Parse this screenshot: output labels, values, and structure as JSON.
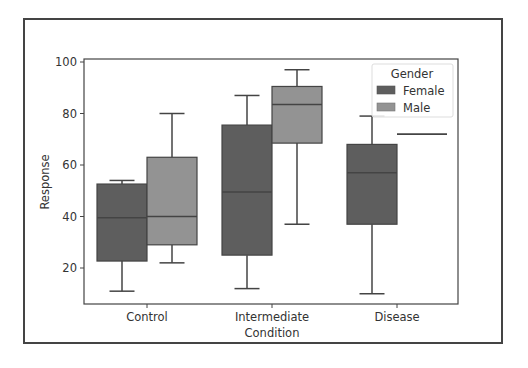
{
  "chart_data": {
    "type": "box",
    "title": "",
    "xlabel": "Condition",
    "ylabel": "Response",
    "categories": [
      "Control",
      "Intermediate",
      "Disease"
    ],
    "yticks": [
      20,
      40,
      60,
      80,
      100
    ],
    "ylim": [
      5.6,
      101
    ],
    "grid": false,
    "legend": {
      "title": "Gender",
      "position": "upper right",
      "entries": [
        "Female",
        "Male"
      ]
    },
    "series": [
      {
        "name": "Female",
        "color": "#5e5e5e",
        "boxes": [
          {
            "category": "Control",
            "whisker_low": 11,
            "q1": 22.7,
            "median": 39.5,
            "q3": 52.6,
            "whisker_high": 54
          },
          {
            "category": "Intermediate",
            "whisker_low": 12,
            "q1": 25,
            "median": 49.5,
            "q3": 75.5,
            "whisker_high": 87
          },
          {
            "category": "Disease",
            "whisker_low": 10,
            "q1": 37,
            "median": 57,
            "q3": 68,
            "whisker_high": 79
          }
        ]
      },
      {
        "name": "Male",
        "color": "#939393",
        "boxes": [
          {
            "category": "Control",
            "whisker_low": 22,
            "q1": 29,
            "median": 40,
            "q3": 63,
            "whisker_high": 80
          },
          {
            "category": "Intermediate",
            "whisker_low": 37,
            "q1": 68.5,
            "median": 83.5,
            "q3": 90.5,
            "whisker_high": 97
          },
          {
            "category": "Disease",
            "whisker_low": 72,
            "q1": 72,
            "median": 72,
            "q3": 72,
            "whisker_high": 72
          }
        ]
      }
    ]
  },
  "axes": {
    "ylabel": "Response",
    "xlabel": "Condition",
    "yticks": [
      "20",
      "40",
      "60",
      "80",
      "100"
    ],
    "xticks": [
      "Control",
      "Intermediate",
      "Disease"
    ]
  },
  "legend": {
    "title": "Gender",
    "female": "Female",
    "male": "Male"
  },
  "colors": {
    "female": "#5e5e5e",
    "male": "#939393",
    "line": "#444444",
    "axis": "#444444"
  }
}
